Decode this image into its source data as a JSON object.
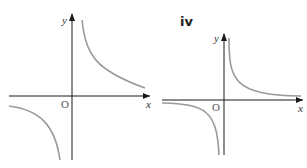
{
  "panels": [
    {
      "label": "i",
      "x_axis_label": "x",
      "y_axis_label": "y",
      "origin_label": "O",
      "description": "Rectangular hyperbola with branches in quadrants I and III (y = k/x, k>0), asymptotes along the axes, vertical asymptote offset slightly right of y-axis"
    },
    {
      "label": "iv",
      "x_axis_label": "x",
      "y_axis_label": "y",
      "origin_label": "O",
      "description": "Hyperbola with branches in quadrants I and III, shifted up slightly; curves hug the axes closely"
    }
  ],
  "colors": {
    "axis": "#1a1a1a",
    "curve": "#9a9a9a",
    "background": "#ffffff"
  }
}
